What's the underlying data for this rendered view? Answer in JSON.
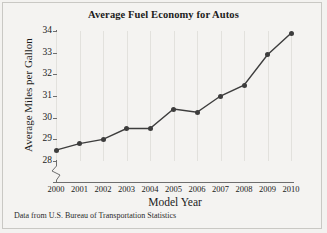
{
  "figure": {
    "source_note": "Data from U.S. Bureau of Transportation Statistics",
    "background_color": "#f3f2f0",
    "border_color": "#c9c8c4"
  },
  "chart_data": {
    "type": "line",
    "title": "Average Fuel Economy for Autos",
    "xlabel": "Model Year",
    "ylabel": "Average Miles per Gallon",
    "categories": [
      "2000",
      "2001",
      "2002",
      "2003",
      "2004",
      "2005",
      "2006",
      "2007",
      "2008",
      "2009",
      "2010"
    ],
    "x": [
      2000,
      2001,
      2002,
      2003,
      2004,
      2005,
      2006,
      2007,
      2008,
      2009,
      2010
    ],
    "values": [
      28.5,
      28.8,
      29.0,
      29.5,
      29.5,
      30.4,
      30.25,
      31.0,
      31.5,
      32.9,
      33.9
    ],
    "ylim": [
      28,
      34
    ],
    "yticks": [
      28,
      29,
      30,
      31,
      32,
      33,
      34
    ],
    "xlim": [
      2000,
      2010
    ],
    "axis_break": true,
    "axis_break_note": "y-axis broken below 28",
    "grid": "vertical",
    "legend": "none",
    "line_color": "#3d3d3d",
    "marker": "circle",
    "marker_color": "#3d3d3d"
  }
}
